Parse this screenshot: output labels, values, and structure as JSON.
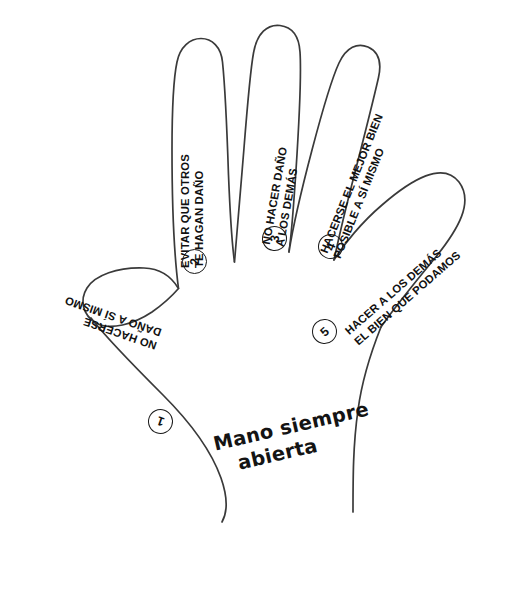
{
  "diagram": {
    "title": "Mano siempre abierta",
    "caption_line1": "Mano siempre",
    "caption_line2": "abierta",
    "ink_color": "#1a1a1a",
    "paper_color": "#ffffff",
    "fingers": [
      {
        "number": "1",
        "part": "thumb",
        "line1": "NO HACERSE",
        "line2": "DAÑO A SÍ MISMO"
      },
      {
        "number": "2",
        "part": "index",
        "line1": "EVITAR QUE OTROS",
        "line2": "TE HAGAN DAÑO"
      },
      {
        "number": "3",
        "part": "middle",
        "line1": "NO HACER DAÑO",
        "line2": "A LOS DEMÁS"
      },
      {
        "number": "4",
        "part": "ring",
        "line1": "HACERSE EL MEJOR BIEN",
        "line2": "POSIBLE A SÍ MISMO"
      },
      {
        "number": "5",
        "part": "pinky",
        "line1": "HACER A LOS DEMÁS",
        "line2": "EL BIEN QUE PODAMOS"
      }
    ]
  }
}
